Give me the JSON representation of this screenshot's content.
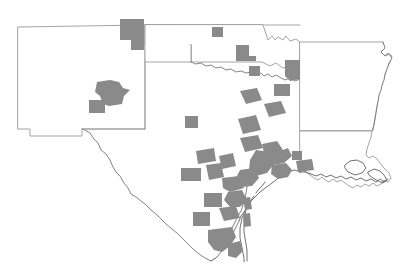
{
  "map": {
    "title": "South Central United States County Distribution Map",
    "description": "Outline map of New Mexico, Texas, Oklahoma, Arkansas and Louisiana with shaded counties",
    "colors": {
      "background": "#ffffff",
      "shaded_county": "#8a8a8a",
      "state_border": "#9a9a9a",
      "coastline": "#4d4d4d"
    },
    "legend": {
      "shaded_meaning": "shaded county"
    },
    "states": [
      {
        "id": "new-mexico",
        "name": "New Mexico",
        "shaded_county_count": 2
      },
      {
        "id": "texas",
        "name": "Texas",
        "shaded_county_count": 30
      },
      {
        "id": "oklahoma",
        "name": "Oklahoma",
        "shaded_county_count": 3
      },
      {
        "id": "arkansas",
        "name": "Arkansas",
        "shaded_county_count": 0
      },
      {
        "id": "louisiana",
        "name": "Louisiana",
        "shaded_county_count": 0
      },
      {
        "id": "colorado-kansas-corner",
        "name": "Colorado Kansas Corner",
        "shaded_county_count": 1
      }
    ],
    "shaded_county_total": 36,
    "clusters": [
      {
        "id": "texas-panhandle-north",
        "label": "Texas Panhandle North",
        "count": 2
      },
      {
        "id": "new-mexico-central",
        "label": "New Mexico Central",
        "count": 2
      },
      {
        "id": "oklahoma-central",
        "label": "Oklahoma Central",
        "count": 2
      },
      {
        "id": "texas-northeast",
        "label": "Texas Northeast",
        "count": 3
      },
      {
        "id": "texas-central",
        "label": "Texas Central",
        "count": 5
      },
      {
        "id": "texas-gulf-coast",
        "label": "Texas Gulf Coast",
        "count": 14
      },
      {
        "id": "texas-south",
        "label": "South Texas",
        "count": 5
      },
      {
        "id": "louisiana-southwest",
        "label": "Louisiana Southwest Border",
        "count": 1
      }
    ]
  }
}
